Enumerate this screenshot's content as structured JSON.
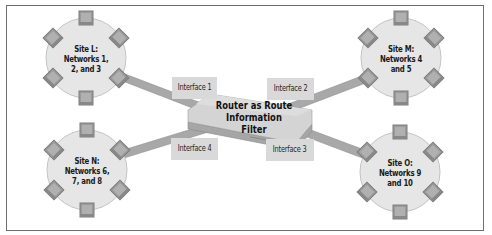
{
  "diagram": {
    "colors": {
      "frame_border": "#6e6e6e",
      "site_fill": "#e6e6e6",
      "site_stroke": "#c4c4c4",
      "node_fill": "#9a9a9a",
      "node_stroke": "#7a7a7a",
      "link_fill": "#a8a8a8",
      "interface_fill": "#d9d9d9",
      "router_top": "#d4d4d4",
      "router_side": "#a6a6a6"
    },
    "router": {
      "label_line1": "Router as Route",
      "label_line2": "Information Filter"
    },
    "interfaces": [
      {
        "label": "Interface 1"
      },
      {
        "label": "Interface 2"
      },
      {
        "label": "Interface 3"
      },
      {
        "label": "Interface 4"
      }
    ],
    "sites": [
      {
        "id": "L",
        "line1": "Site L:",
        "line2": "Networks 1,",
        "line3": "2, and 3"
      },
      {
        "id": "M",
        "line1": "Site M:",
        "line2": "Networks 4",
        "line3": "and 5"
      },
      {
        "id": "N",
        "line1": "Site N:",
        "line2": "Networks 6,",
        "line3": "7, and 8"
      },
      {
        "id": "O",
        "line1": "Site O:",
        "line2": "Networks 9",
        "line3": "and 10"
      }
    ]
  }
}
